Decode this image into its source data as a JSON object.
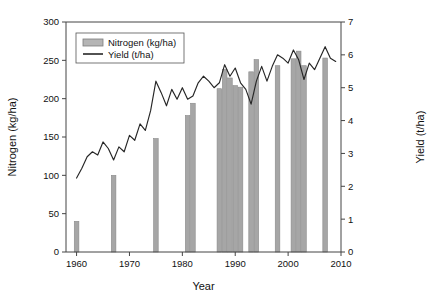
{
  "chart_data": {
    "type": "bar",
    "title": "",
    "xlabel": "Year",
    "ylabel": "Nitrogen (kg/ha)",
    "y2label": "Yield (t/ha)",
    "xlim": [
      1958,
      2010
    ],
    "ylim": [
      0,
      300
    ],
    "y2lim": [
      0,
      7
    ],
    "grid": false,
    "legend_position": "top-left",
    "x_ticks": [
      "1960",
      "1970",
      "1980",
      "1990",
      "2000",
      "2010"
    ],
    "x_tick_values": [
      1960,
      1970,
      1980,
      1990,
      2000,
      2010
    ],
    "y_ticks": [
      "0",
      "50",
      "100",
      "150",
      "200",
      "250",
      "300"
    ],
    "y_tick_values": [
      0,
      50,
      100,
      150,
      200,
      250,
      300
    ],
    "y2_ticks": [
      "0",
      "1",
      "2",
      "3",
      "4",
      "5",
      "6",
      "7"
    ],
    "y2_tick_values": [
      0,
      1,
      2,
      3,
      4,
      5,
      6,
      7
    ],
    "series": [
      {
        "name": "Nitrogen (kg/ha)",
        "type": "bar",
        "axis": "left",
        "color": "#a6a6a6",
        "x": [
          1960,
          1967,
          1975,
          1981,
          1982,
          1987,
          1988,
          1989,
          1990,
          1991,
          1993,
          1994,
          1998,
          2001,
          2002,
          2003,
          2007
        ],
        "values": [
          40,
          100,
          148,
          178,
          194,
          213,
          238,
          227,
          217,
          215,
          235,
          251,
          243,
          252,
          262,
          243,
          253
        ]
      },
      {
        "name": "Yield (t/ha)",
        "type": "line",
        "axis": "right",
        "color": "#262626",
        "x": [
          1960,
          1961,
          1962,
          1963,
          1964,
          1965,
          1966,
          1967,
          1968,
          1969,
          1970,
          1971,
          1972,
          1973,
          1974,
          1975,
          1976,
          1977,
          1978,
          1979,
          1980,
          1981,
          1982,
          1983,
          1984,
          1985,
          1986,
          1987,
          1988,
          1989,
          1990,
          1991,
          1992,
          1993,
          1994,
          1995,
          1996,
          1997,
          1998,
          1999,
          2000,
          2001,
          2002,
          2003,
          2004,
          2005,
          2006,
          2007,
          2008,
          2009
        ],
        "values": [
          2.25,
          2.55,
          2.9,
          3.05,
          2.95,
          3.35,
          3.15,
          2.8,
          3.2,
          3.05,
          3.55,
          3.4,
          3.9,
          3.7,
          4.3,
          5.2,
          4.85,
          4.45,
          4.95,
          4.65,
          5.0,
          4.65,
          4.75,
          5.15,
          5.35,
          5.2,
          5.0,
          5.15,
          5.7,
          5.35,
          5.6,
          5.15,
          4.95,
          4.5,
          5.2,
          5.65,
          5.2,
          5.65,
          6.0,
          5.9,
          5.75,
          6.15,
          5.85,
          5.25,
          5.75,
          5.55,
          5.9,
          6.25,
          5.9,
          5.8
        ]
      }
    ]
  },
  "legend": {
    "items": [
      {
        "label": "Nitrogen (kg/ha)",
        "marker": "bar-swatch"
      },
      {
        "label": "Yield (t/ha)",
        "marker": "line-swatch"
      }
    ]
  }
}
